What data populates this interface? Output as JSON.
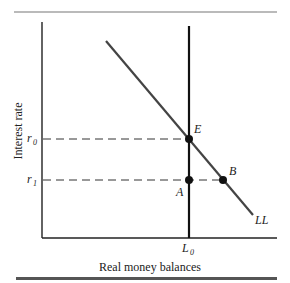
{
  "diagram": {
    "y_axis_label": "Interest rate",
    "x_axis_label": "Real money balances",
    "y_ticks": [
      {
        "base": "r",
        "sub": "0",
        "value": "r0"
      },
      {
        "base": "r",
        "sub": "1",
        "value": "r1"
      }
    ],
    "x_ticks": [
      {
        "base": "L",
        "sub": "0",
        "value": "L0"
      }
    ],
    "curves": [
      {
        "name": "LL",
        "label": "LL",
        "type": "downward-sloping demand"
      },
      {
        "name": "money-supply",
        "label": "",
        "type": "vertical at L0"
      }
    ],
    "points": [
      {
        "label": "E",
        "at": "L0, r0",
        "description": "equilibrium"
      },
      {
        "label": "A",
        "at": "L0, r1"
      },
      {
        "label": "B",
        "at": "on LL, r1"
      }
    ]
  }
}
